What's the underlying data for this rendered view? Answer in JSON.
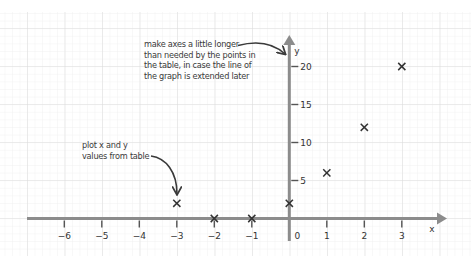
{
  "chart_data": {
    "type": "scatter",
    "title": "",
    "xlabel": "x",
    "ylabel": "y",
    "xlim": [
      -6.7,
      4.2
    ],
    "ylim": [
      -3,
      24
    ],
    "x_ticks": [
      -6,
      -5,
      -4,
      -3,
      -2,
      -1,
      0,
      1,
      2,
      3
    ],
    "x_tick_labels": [
      "−6",
      "−5",
      "−4",
      "−3",
      "−2",
      "−1",
      "0",
      "1",
      "2",
      "3"
    ],
    "y_ticks": [
      5,
      10,
      15,
      20
    ],
    "y_tick_labels": [
      "5",
      "10",
      "15",
      "20"
    ],
    "grid": true,
    "marker": "x",
    "series": [
      {
        "name": "plotted points",
        "x": [
          -3,
          -2,
          -1,
          0,
          1,
          2,
          3
        ],
        "y": [
          2,
          0,
          0,
          2,
          6,
          12,
          20
        ]
      }
    ],
    "annotations": [
      {
        "id": "axes-note",
        "lines": [
          "make axes a little longer",
          "than needed by the points in",
          "the table, in case the line of",
          "the graph is extended later"
        ],
        "points_to": "y-axis arrowhead"
      },
      {
        "id": "plot-note",
        "lines": [
          "plot x and y",
          "values from table"
        ],
        "points_to": [
          -3,
          2
        ]
      }
    ]
  },
  "colors": {
    "axis": "#8c8c8c",
    "tick": "#555555",
    "marker": "#333333",
    "text": "#333333",
    "grid_minor": "#ececec",
    "grid_major": "#d6d6d6"
  }
}
